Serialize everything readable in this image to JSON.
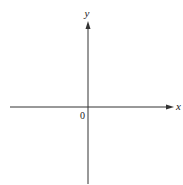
{
  "diagram": {
    "type": "cartesian-axes",
    "x_axis": {
      "label": "x",
      "from": [
        10,
        107
      ],
      "to": [
        173,
        107
      ],
      "arrow": true
    },
    "y_axis": {
      "label": "y",
      "from": [
        88,
        184
      ],
      "to": [
        88,
        22
      ],
      "arrow": true
    },
    "origin": {
      "label": "0",
      "position": [
        88,
        107
      ]
    },
    "colors": {
      "axis": "#333333",
      "text": "#222222",
      "background": "#ffffff"
    }
  }
}
